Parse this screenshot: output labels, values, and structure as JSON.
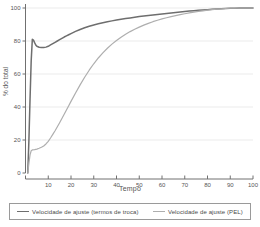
{
  "chart_data": {
    "type": "line",
    "title": "",
    "xlabel": "Tempo",
    "ylabel": "% do total",
    "xlim": [
      0,
      100
    ],
    "ylim": [
      0,
      100
    ],
    "xticks": [
      10,
      20,
      30,
      40,
      50,
      60,
      70,
      80,
      90,
      100
    ],
    "yticks": [
      0,
      20,
      40,
      60,
      80,
      100
    ],
    "grid": "horizontal",
    "legend_position": "bottom",
    "series": [
      {
        "name": "Velocidade de ajuste (termos de troca)",
        "color": "#6e6e6e",
        "x": [
          1,
          1.5,
          2,
          2.5,
          3,
          3.5,
          4,
          4.5,
          5,
          6,
          7,
          8,
          9,
          10,
          11,
          12,
          13,
          14,
          15,
          16,
          17,
          18,
          19,
          20,
          22,
          24,
          26,
          28,
          30,
          32,
          34,
          36,
          38,
          40,
          42,
          44,
          46,
          48,
          50,
          52,
          54,
          56,
          58,
          60,
          62,
          64,
          66,
          68,
          70,
          72,
          74,
          76,
          78,
          80,
          82,
          84,
          86,
          88,
          90,
          92,
          94,
          96,
          98,
          100
        ],
        "y": [
          0,
          20,
          45,
          68,
          81,
          80.5,
          79,
          77.6,
          76.8,
          76.2,
          76.0,
          76.0,
          76.3,
          76.8,
          77.6,
          78.4,
          79.2,
          80.0,
          80.8,
          81.6,
          82.4,
          83.1,
          83.8,
          84.5,
          85.8,
          87.0,
          88.0,
          88.9,
          89.7,
          90.4,
          91.1,
          91.7,
          92.2,
          92.7,
          93.2,
          93.6,
          94.0,
          94.4,
          94.8,
          95.2,
          95.5,
          95.8,
          96.1,
          96.4,
          96.7,
          97.0,
          97.3,
          97.6,
          97.9,
          98.2,
          98.4,
          98.6,
          98.8,
          99.0,
          99.2,
          99.4,
          99.6,
          99.7,
          99.8,
          99.9,
          99.95,
          100,
          100,
          100
        ]
      },
      {
        "name": "Velocidade de ajuste (PEL)",
        "color": "#aeaeae",
        "x": [
          1,
          1.5,
          2,
          2.5,
          3,
          4,
          5,
          6,
          7,
          8,
          9,
          10,
          11,
          12,
          13,
          14,
          15,
          16,
          17,
          18,
          19,
          20,
          22,
          24,
          26,
          28,
          30,
          32,
          34,
          36,
          38,
          40,
          42,
          44,
          46,
          48,
          50,
          52,
          54,
          56,
          58,
          60,
          62,
          64,
          66,
          68,
          70,
          72,
          74,
          76,
          78,
          80,
          82,
          84,
          86,
          88,
          90,
          92,
          94,
          96,
          98,
          100
        ],
        "y": [
          0,
          6,
          11,
          13.5,
          14,
          14.2,
          14.5,
          15.0,
          15.6,
          16.4,
          17.6,
          19.2,
          21.2,
          23.4,
          25.6,
          28.0,
          30.5,
          33.0,
          35.6,
          38.2,
          40.8,
          43.4,
          48.5,
          53.4,
          58.0,
          62.3,
          66.2,
          69.7,
          72.8,
          75.6,
          78.1,
          80.3,
          82.3,
          84.1,
          85.7,
          87.1,
          88.4,
          89.6,
          90.7,
          91.7,
          92.6,
          93.4,
          94.1,
          94.8,
          95.4,
          96.0,
          96.5,
          97.0,
          97.5,
          97.9,
          98.3,
          98.7,
          99.0,
          99.3,
          99.5,
          99.7,
          99.85,
          99.95,
          100,
          100,
          100,
          100
        ]
      }
    ]
  },
  "legend": {
    "entries": [
      {
        "label": "Velocidade de ajuste (termos de troca)",
        "color": "#6e6e6e"
      },
      {
        "label": "Velocidade de ajuste (PEL)",
        "color": "#aeaeae"
      }
    ]
  },
  "axes": {
    "x_title": "Tempo",
    "y_title": "% do total",
    "x_tick_labels": [
      "10",
      "20",
      "30",
      "40",
      "50",
      "60",
      "70",
      "80",
      "90",
      "100"
    ],
    "y_tick_labels": [
      "0",
      "20",
      "40",
      "60",
      "80",
      "100"
    ]
  },
  "colors": {
    "series_primary": "#6e6e6e",
    "series_secondary": "#aeaeae",
    "axis": "#707070",
    "grid": "#e6e6e6",
    "text": "#555555",
    "legend_border": "#9a9a9a",
    "background": "#ffffff"
  }
}
